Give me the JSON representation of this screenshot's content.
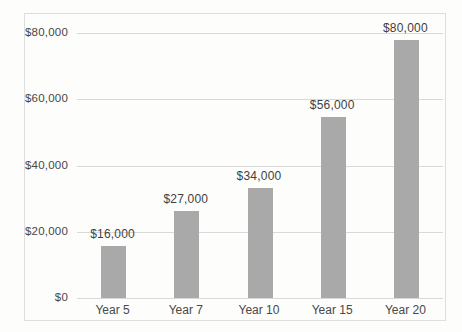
{
  "chart_data": {
    "type": "bar",
    "title": "",
    "xlabel": "",
    "ylabel": "",
    "categories": [
      "Year 5",
      "Year 7",
      "Year 10",
      "Year 15",
      "Year 20"
    ],
    "values": [
      16000,
      27000,
      34000,
      56000,
      80000
    ],
    "data_labels": [
      "$16,000",
      "$27,000",
      "$34,000",
      "$56,000",
      "$80,000"
    ],
    "y_ticks": [
      {
        "value": 0,
        "label": "$0"
      },
      {
        "value": 20000,
        "label": "$20,000"
      },
      {
        "value": 40000,
        "label": "$40,000"
      },
      {
        "value": 60000,
        "label": "$60,000"
      },
      {
        "value": 80000,
        "label": "$80,000"
      }
    ],
    "ylim": [
      0,
      80000
    ],
    "grid": true,
    "legend": "none",
    "colors": {
      "bar": "#a9a9a9",
      "gridline": "#d9d9d9",
      "frame_border": "#dedede",
      "text": "#474747",
      "background": "#fdfdfc"
    }
  }
}
